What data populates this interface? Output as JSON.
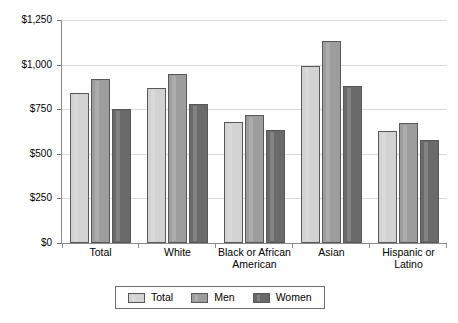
{
  "chart_data": {
    "type": "bar",
    "title": "",
    "xlabel": "",
    "ylabel": "",
    "ylim": [
      0,
      1250
    ],
    "ytick_values": [
      0,
      250,
      500,
      750,
      1000,
      1250
    ],
    "ytick_labels": [
      "$0",
      "$250",
      "$500",
      "$750",
      "$1,000",
      "$1,250"
    ],
    "grid": true,
    "legend_position": "bottom",
    "categories": [
      "Total",
      "White",
      "Black or African American",
      "Asian",
      "Hispanic or Latino"
    ],
    "series": [
      {
        "name": "Total",
        "color": "#d2d2d2",
        "values": [
          840,
          870,
          680,
          995,
          630
        ]
      },
      {
        "name": "Men",
        "color": "#9d9d9d",
        "values": [
          920,
          950,
          720,
          1130,
          675
        ]
      },
      {
        "name": "Women",
        "color": "#6a6a6a",
        "values": [
          750,
          780,
          635,
          880,
          575
        ]
      }
    ]
  },
  "axis": {
    "ticks": [
      {
        "label": "$1,250",
        "value": 1250
      },
      {
        "label": "$1,000",
        "value": 1000
      },
      {
        "label": "$750",
        "value": 750
      },
      {
        "label": "$500",
        "value": 500
      },
      {
        "label": "$250",
        "value": 250
      },
      {
        "label": "$0",
        "value": 0
      }
    ]
  },
  "legend": {
    "items": [
      {
        "label": "Total"
      },
      {
        "label": "Men"
      },
      {
        "label": "Women"
      }
    ]
  },
  "colors": {
    "series_total": "#d2d2d2",
    "series_men": "#9d9d9d",
    "series_women": "#6a6a6a",
    "bar_outline": "#58585a",
    "gridline": "#d9d9d9",
    "axis": "#8a8a8a",
    "background": "#ffffff"
  }
}
